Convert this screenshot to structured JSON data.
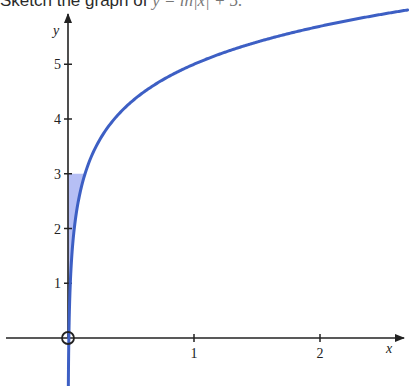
{
  "prompt": {
    "text": "Sketch the graph of ",
    "equation": "y = ln|x| + 5."
  },
  "chart_data": {
    "type": "line",
    "title": "Sketch the graph of y = ln|x| + 5.",
    "function": "y = ln(x) + 5",
    "xlabel": "x",
    "ylabel": "y",
    "xlim": [
      -0.5,
      2.7
    ],
    "ylim": [
      -0.9,
      6.1
    ],
    "x_ticks": [
      1,
      2
    ],
    "x_tick_labels": [
      "1",
      "2"
    ],
    "y_ticks": [
      1,
      2,
      3,
      4,
      5
    ],
    "y_tick_labels": [
      "1",
      "2",
      "3",
      "4",
      "5"
    ],
    "grid": false,
    "legend": null,
    "series": [
      {
        "name": "y = ln x + 5",
        "color": "#3d5fc4",
        "x": [
          0.0025,
          0.0067,
          0.0183,
          0.0498,
          0.1353,
          0.25,
          0.3679,
          0.5,
          0.75,
          1.0,
          1.5,
          2.0,
          2.5,
          2.7
        ],
        "y": [
          -1.0,
          0.0,
          1.0,
          2.0,
          3.0,
          3.61,
          4.0,
          4.31,
          4.71,
          5.0,
          5.41,
          5.69,
          5.92,
          5.99
        ]
      }
    ],
    "annotations": [
      {
        "type": "open-circle",
        "x": 0,
        "y": 0,
        "label": "origin excluded (x = 0 not in domain)"
      },
      {
        "type": "shaded-region",
        "description": "region between y-axis and curve",
        "y_from": 0,
        "y_to": 3,
        "color": "#8f9cf0"
      }
    ]
  },
  "colors": {
    "curve": "#3d5fc4",
    "shade": "#8f9cf0",
    "axis": "#222222"
  }
}
